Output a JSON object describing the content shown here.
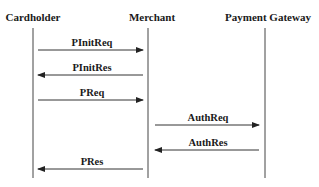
{
  "diagram": {
    "type": "sequence",
    "actors": [
      {
        "id": "cardholder",
        "label": "Cardholder",
        "x": 33
      },
      {
        "id": "merchant",
        "label": "Merchant",
        "x": 148
      },
      {
        "id": "gateway",
        "label": "Payment Gateway",
        "x": 265
      }
    ],
    "messages": [
      {
        "label": "PInitReq",
        "from": "cardholder",
        "to": "merchant",
        "y": 50
      },
      {
        "label": "PInitRes",
        "from": "merchant",
        "to": "cardholder",
        "y": 75
      },
      {
        "label": "PReq",
        "from": "cardholder",
        "to": "merchant",
        "y": 100
      },
      {
        "label": "AuthReq",
        "from": "merchant",
        "to": "gateway",
        "y": 125
      },
      {
        "label": "AuthRes",
        "from": "gateway",
        "to": "merchant",
        "y": 150
      },
      {
        "label": "PRes",
        "from": "merchant",
        "to": "cardholder",
        "y": 169
      }
    ],
    "colors": {
      "line": "#333333",
      "text": "#1a1a1a",
      "background": "#ffffff"
    }
  }
}
